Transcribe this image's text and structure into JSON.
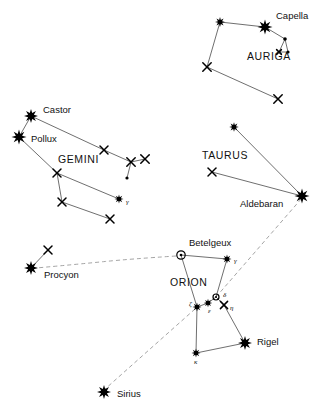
{
  "chart_data": {
    "type": "scatter",
    "width": 323,
    "height": 411,
    "grid": false,
    "legend": false,
    "colors": {
      "background": "#ffffff",
      "star": "#000000",
      "constellation_line": "#4a4a4a",
      "guide_line": "#9a9a9a",
      "text": "#111111"
    },
    "constellations": [
      {
        "name": "AURIGA",
        "label_x": 247,
        "label_y": 57,
        "stars": [
          {
            "id": "aur-beta",
            "x": 220,
            "y": 22,
            "marker": "burst",
            "size": 5.0
          },
          {
            "id": "aur-capella",
            "x": 265,
            "y": 27,
            "marker": "burst",
            "size": 7.5,
            "label": "Capella",
            "label_x": 276,
            "label_y": 16
          },
          {
            "id": "aur-iota",
            "x": 207,
            "y": 67,
            "marker": "x",
            "size": 4.2
          },
          {
            "id": "aur-south",
            "x": 278,
            "y": 99,
            "marker": "x",
            "size": 4.2
          },
          {
            "id": "aur-kid1",
            "x": 285,
            "y": 39,
            "marker": "dot",
            "size": 1.8
          },
          {
            "id": "aur-kid2",
            "x": 279,
            "y": 52,
            "marker": "x",
            "size": 2.4
          },
          {
            "id": "aur-kid3",
            "x": 288,
            "y": 52,
            "marker": "dot",
            "size": 1.6
          }
        ],
        "lines": [
          [
            "aur-beta",
            "aur-capella"
          ],
          [
            "aur-beta",
            "aur-iota"
          ],
          [
            "aur-iota",
            "aur-south"
          ],
          [
            "aur-capella",
            "aur-kid1"
          ],
          [
            "aur-kid1",
            "aur-kid2"
          ],
          [
            "aur-kid2",
            "aur-kid3"
          ],
          [
            "aur-kid3",
            "aur-kid1"
          ]
        ]
      },
      {
        "name": "GEMINI",
        "label_x": 58,
        "label_y": 160,
        "stars": [
          {
            "id": "gem-castor",
            "x": 31,
            "y": 116,
            "marker": "burst",
            "size": 7.0,
            "label": "Castor",
            "label_x": 43,
            "label_y": 110
          },
          {
            "id": "gem-pollux",
            "x": 19,
            "y": 137,
            "marker": "burst",
            "size": 7.5,
            "label": "Pollux",
            "label_x": 31,
            "label_y": 139
          },
          {
            "id": "gem-e1",
            "x": 104,
            "y": 150,
            "marker": "x",
            "size": 4.0
          },
          {
            "id": "gem-e2",
            "x": 131,
            "y": 162,
            "marker": "x",
            "size": 4.2
          },
          {
            "id": "gem-e3",
            "x": 145,
            "y": 159,
            "marker": "x",
            "size": 4.2
          },
          {
            "id": "gem-e4",
            "x": 127,
            "y": 178,
            "marker": "dot",
            "size": 1.6
          },
          {
            "id": "gem-mid",
            "x": 57,
            "y": 173,
            "marker": "x",
            "size": 4.0
          },
          {
            "id": "gem-low",
            "x": 62,
            "y": 202,
            "marker": "x",
            "size": 4.0
          },
          {
            "id": "gem-gamma",
            "x": 119,
            "y": 199,
            "marker": "burst",
            "size": 4.5,
            "greek": "γ",
            "greek_x": 126,
            "greek_y": 202
          },
          {
            "id": "gem-bot",
            "x": 110,
            "y": 219,
            "marker": "x",
            "size": 4.0
          }
        ],
        "lines": [
          [
            "gem-castor",
            "gem-pollux"
          ],
          [
            "gem-castor",
            "gem-e1"
          ],
          [
            "gem-e1",
            "gem-e2"
          ],
          [
            "gem-e2",
            "gem-e3"
          ],
          [
            "gem-e2",
            "gem-e4"
          ],
          [
            "gem-pollux",
            "gem-mid"
          ],
          [
            "gem-mid",
            "gem-low"
          ],
          [
            "gem-mid",
            "gem-gamma"
          ],
          [
            "gem-low",
            "gem-bot"
          ]
        ]
      },
      {
        "name": "TAURUS",
        "label_x": 202,
        "label_y": 156,
        "stars": [
          {
            "id": "tau-beta",
            "x": 234,
            "y": 127,
            "marker": "burst",
            "size": 4.8
          },
          {
            "id": "tau-zeta",
            "x": 212,
            "y": 172,
            "marker": "x",
            "size": 4.0
          },
          {
            "id": "tau-aldebaran",
            "x": 302,
            "y": 196,
            "marker": "burst",
            "size": 7.5,
            "label": "Aldebaran",
            "label_x": 240,
            "label_y": 204
          }
        ],
        "lines": [
          [
            "tau-beta",
            "tau-aldebaran"
          ],
          [
            "tau-zeta",
            "tau-aldebaran"
          ]
        ]
      },
      {
        "name": "ORION",
        "label_x": 170,
        "label_y": 283,
        "stars": [
          {
            "id": "ori-betelgeux",
            "x": 181,
            "y": 255,
            "marker": "open",
            "size": 4.2,
            "label": "Betelgeux",
            "label_x": 189,
            "label_y": 243
          },
          {
            "id": "ori-gamma",
            "x": 227,
            "y": 259,
            "marker": "burst",
            "size": 4.5,
            "greek": "γ",
            "greek_x": 234,
            "greek_y": 261
          },
          {
            "id": "ori-delta",
            "x": 216,
            "y": 297,
            "marker": "open",
            "size": 3.0,
            "greek": "δ",
            "greek_x": 223,
            "greek_y": 295
          },
          {
            "id": "ori-epsilon",
            "x": 208,
            "y": 303,
            "marker": "burst",
            "size": 4.2,
            "greek": "ε",
            "greek_x": 208,
            "greek_y": 311
          },
          {
            "id": "ori-zeta",
            "x": 197,
            "y": 307,
            "marker": "burst",
            "size": 4.5,
            "greek": "ζ",
            "greek_x": 189,
            "greek_y": 304
          },
          {
            "id": "ori-eta",
            "x": 224,
            "y": 305,
            "marker": "x",
            "size": 3.6,
            "greek": "η",
            "greek_x": 230,
            "greek_y": 308
          },
          {
            "id": "ori-kappa",
            "x": 196,
            "y": 353,
            "marker": "burst",
            "size": 4.5,
            "greek": "κ",
            "greek_x": 194,
            "greek_y": 362
          },
          {
            "id": "ori-rigel",
            "x": 245,
            "y": 343,
            "marker": "burst",
            "size": 7.0,
            "label": "Rigel",
            "label_x": 257,
            "label_y": 342
          }
        ],
        "lines": [
          [
            "ori-betelgeux",
            "ori-gamma"
          ],
          [
            "ori-betelgeux",
            "ori-zeta"
          ],
          [
            "ori-gamma",
            "ori-delta"
          ],
          [
            "ori-zeta",
            "ori-epsilon"
          ],
          [
            "ori-epsilon",
            "ori-delta"
          ],
          [
            "ori-delta",
            "ori-eta"
          ],
          [
            "ori-eta",
            "ori-rigel"
          ],
          [
            "ori-zeta",
            "ori-kappa"
          ],
          [
            "ori-kappa",
            "ori-rigel"
          ]
        ]
      },
      {
        "name": "CANIS MINOR",
        "label_x": null,
        "label_y": null,
        "stars": [
          {
            "id": "cmi-procyon",
            "x": 31,
            "y": 268,
            "marker": "burst",
            "size": 7.0,
            "label": "Procyon",
            "label_x": 44,
            "label_y": 275
          },
          {
            "id": "cmi-beta",
            "x": 48,
            "y": 250,
            "marker": "x",
            "size": 4.0
          }
        ],
        "lines": [
          [
            "cmi-procyon",
            "cmi-beta"
          ]
        ]
      },
      {
        "name": "CANIS MAJOR",
        "label_x": null,
        "label_y": null,
        "stars": [
          {
            "id": "cma-sirius",
            "x": 104,
            "y": 392,
            "marker": "burst",
            "size": 7.0,
            "label": "Sirius",
            "label_x": 117,
            "label_y": 394
          }
        ],
        "lines": []
      }
    ],
    "guide_lines": [
      {
        "id": "guide-belt-to-aldebaran",
        "from": "ori-delta",
        "to": "tau-aldebaran",
        "style": "dashed",
        "points": [
          [
            216,
            297
          ],
          [
            302,
            198
          ]
        ]
      },
      {
        "id": "guide-belt-to-sirius",
        "from": "ori-zeta",
        "to": "cma-sirius",
        "style": "dashed",
        "points": [
          [
            195,
            309
          ],
          [
            104,
            390
          ]
        ]
      },
      {
        "id": "guide-betelgeux-to-procyon",
        "from": "ori-betelgeux",
        "to": "cmi-procyon",
        "style": "dashed-curve",
        "points": [
          [
            176,
            256
          ],
          [
            130,
            259
          ],
          [
            80,
            264
          ],
          [
            36,
            268
          ]
        ]
      }
    ]
  },
  "labels": {
    "capella": "Capella",
    "auriga": "AURIGA",
    "castor": "Castor",
    "pollux": "Pollux",
    "gemini": "GEMINI",
    "taurus": "TAURUS",
    "aldebaran": "Aldebaran",
    "betelgeux": "Betelgeux",
    "orion": "ORION",
    "rigel": "Rigel",
    "procyon": "Procyon",
    "sirius": "Sirius",
    "greek_gamma": "γ",
    "greek_delta": "δ",
    "greek_epsilon": "ε",
    "greek_zeta": "ζ",
    "greek_eta": "η",
    "greek_kappa": "κ"
  }
}
